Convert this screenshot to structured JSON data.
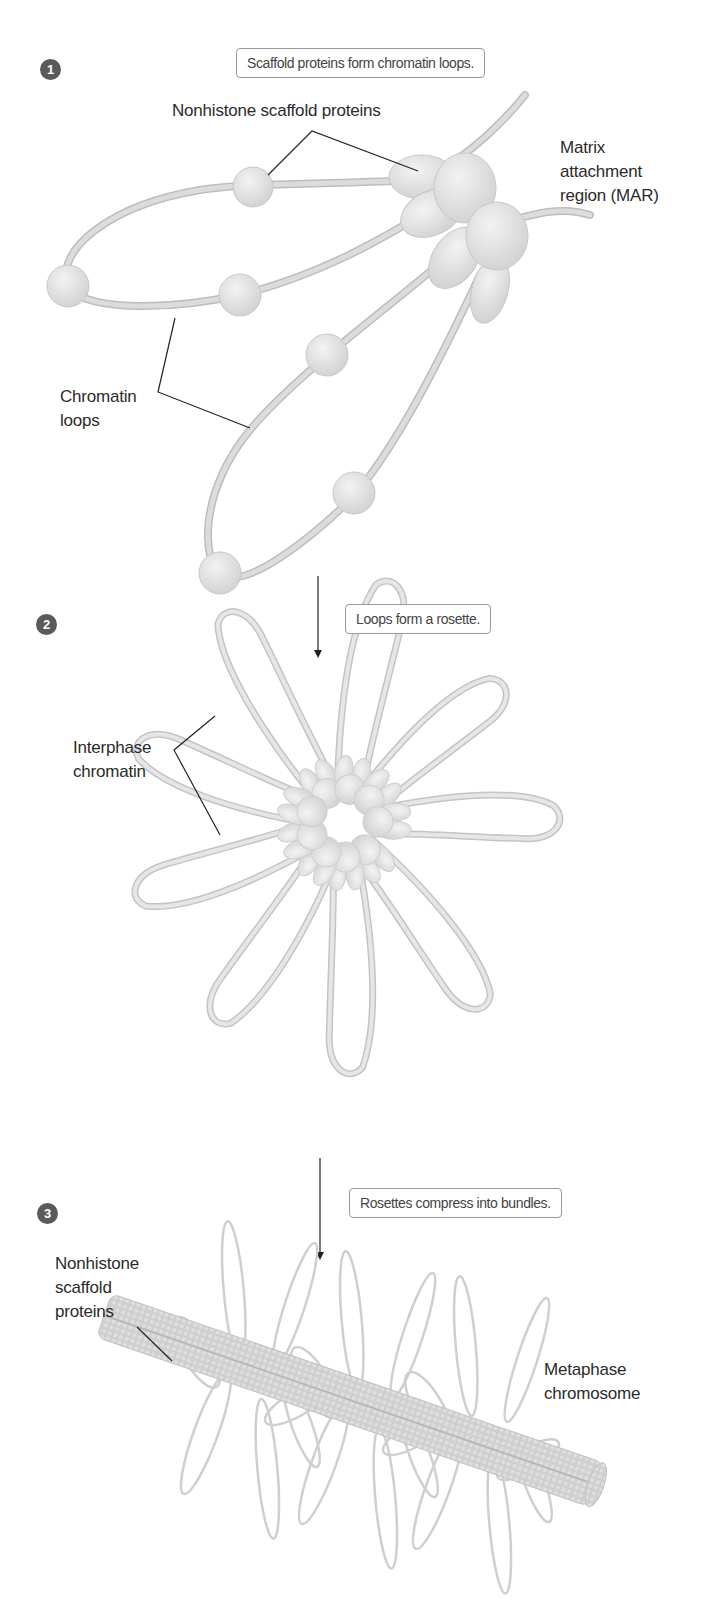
{
  "steps": [
    {
      "number": "1",
      "caption": "Scaffold proteins form chromatin loops."
    },
    {
      "number": "2",
      "caption": "Loops form a rosette."
    },
    {
      "number": "3",
      "caption": "Rosettes compress into bundles."
    }
  ],
  "labels": {
    "nonhistone_top": "Nonhistone scaffold proteins",
    "mar_line1": "Matrix",
    "mar_line2": "attachment",
    "mar_line3": "region (MAR)",
    "chromatin_loops_line1": "Chromatin",
    "chromatin_loops_line2": "loops",
    "interphase_line1": "Interphase",
    "interphase_line2": "chromatin",
    "nonhistone_bottom_line1": "Nonhistone",
    "nonhistone_bottom_line2": "scaffold",
    "nonhistone_bottom_line3": "proteins",
    "metaphase_line1": "Metaphase",
    "metaphase_line2": "chromosome"
  },
  "colors": {
    "badge": "#5a5a5a",
    "fiber": "#d6d6d6",
    "fiber_edge": "#bdbdbd",
    "protein": "#e2e2e2",
    "leader": "#222222",
    "caption_border": "#9a9a9a"
  }
}
